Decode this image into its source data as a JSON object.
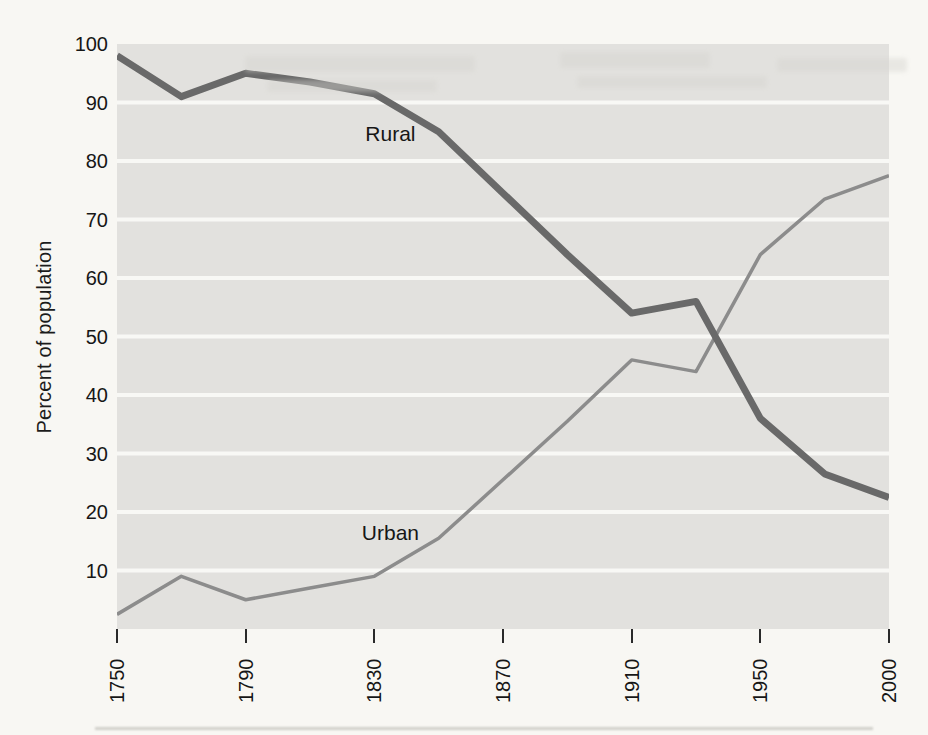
{
  "figure_name": "Rural and urban share of population, 1750-2000",
  "colors": {
    "page_background": "#f8f7f3",
    "plot_background": "#e2e1de",
    "gridline": "#f8f8f5",
    "text": "#161616",
    "tick_mark": "#2a2a2a",
    "rural_line": "#696969",
    "urban_line": "#8c8c8c"
  },
  "chart_data": {
    "type": "line",
    "title": "",
    "xlabel": "",
    "ylabel": "Percent of population",
    "ylim": [
      0,
      100
    ],
    "yticks": [
      100,
      90,
      80,
      70,
      60,
      50,
      40,
      30,
      20,
      10
    ],
    "ytick_labels": [
      "100",
      "90",
      "80",
      "70",
      "60",
      "50",
      "40",
      "30",
      "20",
      "10"
    ],
    "xtick_years": [
      1750,
      1790,
      1830,
      1870,
      1910,
      1950,
      2000
    ],
    "xtick_labels": [
      "1750",
      "1790",
      "1830",
      "1870",
      "1910",
      "1950",
      "2000"
    ],
    "x_axis_note": "ticks evenly spaced; the 1950-2000 interval occupies the same width as the 40-year intervals",
    "grid": "horizontal white gridlines over shaded plot band; no axis frame",
    "legend": "inline labels next to lines",
    "series": [
      {
        "name": "Urban",
        "color": "#8c8c8c",
        "stroke_width": 3.5,
        "points": [
          [
            1750,
            2.5
          ],
          [
            1770,
            9
          ],
          [
            1790,
            5
          ],
          [
            1810,
            7
          ],
          [
            1830,
            9
          ],
          [
            1850,
            15.5
          ],
          [
            1870,
            25.5
          ],
          [
            1890,
            35.5
          ],
          [
            1910,
            46
          ],
          [
            1930,
            44
          ],
          [
            1950,
            64
          ],
          [
            1975,
            73.5
          ],
          [
            2000,
            77.5
          ]
        ]
      },
      {
        "name": "Rural",
        "color": "#696969",
        "stroke_width": 7,
        "points": [
          [
            1750,
            98
          ],
          [
            1770,
            91
          ],
          [
            1790,
            95
          ],
          [
            1810,
            93.5
          ],
          [
            1830,
            91.5
          ],
          [
            1850,
            85
          ],
          [
            1870,
            74.5
          ],
          [
            1890,
            64
          ],
          [
            1910,
            54
          ],
          [
            1930,
            56
          ],
          [
            1950,
            36
          ],
          [
            1975,
            26.5
          ],
          [
            2000,
            22.5
          ]
        ]
      }
    ],
    "annotations": [
      {
        "text": "Rural",
        "x": 1835,
        "y": 84.3
      },
      {
        "text": "Urban",
        "x": 1835,
        "y": 16.2
      }
    ]
  }
}
